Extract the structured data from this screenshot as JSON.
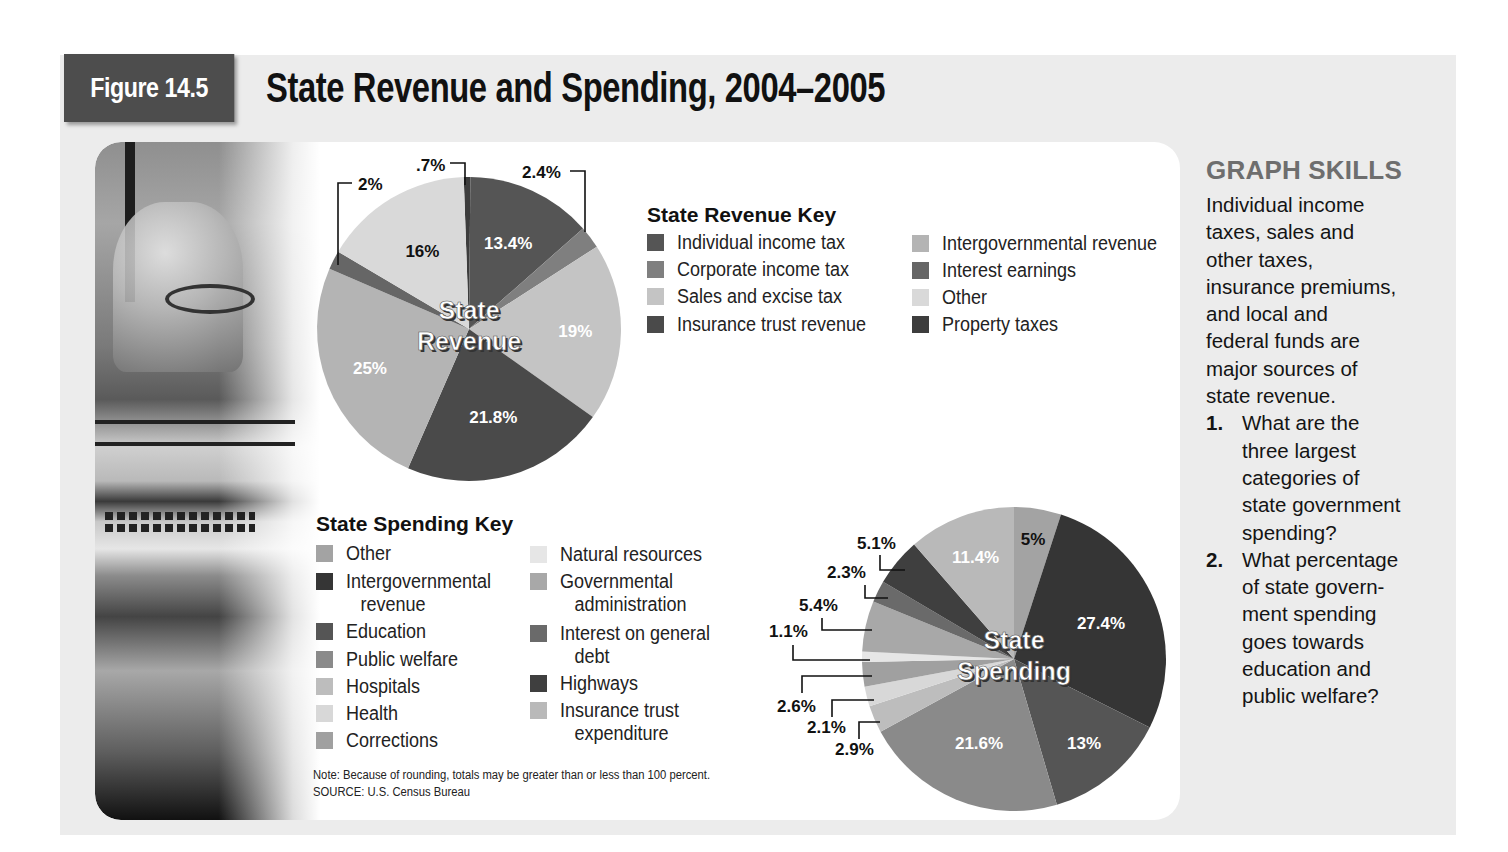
{
  "figure": {
    "tag": "Figure 14.5",
    "title": "State Revenue and Spending, 2004–2005"
  },
  "revenue_key": {
    "title": "State Revenue Key",
    "items": [
      {
        "label": "Individual income tax",
        "color": "#555555"
      },
      {
        "label": "Corporate income tax",
        "color": "#7f7f7f"
      },
      {
        "label": "Sales and excise tax",
        "color": "#c4c4c4"
      },
      {
        "label": "Insurance trust revenue",
        "color": "#4a4a4a"
      },
      {
        "label": "Intergovernmental revenue",
        "color": "#b4b4b4"
      },
      {
        "label": "Interest earnings",
        "color": "#666666"
      },
      {
        "label": "Other",
        "color": "#d9d9d9"
      },
      {
        "label": "Property taxes",
        "color": "#3d3d3d"
      }
    ]
  },
  "spending_key": {
    "title": "State Spending Key",
    "items": [
      {
        "label": "Other",
        "label2": "",
        "color": "#a3a3a3"
      },
      {
        "label": "Intergovernmental",
        "label2": "revenue",
        "color": "#353535"
      },
      {
        "label": "Education",
        "label2": "",
        "color": "#555555"
      },
      {
        "label": "Public welfare",
        "label2": "",
        "color": "#8a8a8a"
      },
      {
        "label": "Hospitals",
        "label2": "",
        "color": "#bdbdbd"
      },
      {
        "label": "Health",
        "label2": "",
        "color": "#d8d8d8"
      },
      {
        "label": "Corrections",
        "label2": "",
        "color": "#a0a0a0"
      },
      {
        "label": "Natural resources",
        "label2": "",
        "color": "#e6e6e6"
      },
      {
        "label": "Governmental",
        "label2": "administration",
        "color": "#a8a8a8"
      },
      {
        "label": "Interest on general",
        "label2": "debt",
        "color": "#6a6a6a"
      },
      {
        "label": "Highways",
        "label2": "",
        "color": "#3f3f3f"
      },
      {
        "label": "Insurance trust",
        "label2": "expenditure",
        "color": "#b9b9b9"
      }
    ]
  },
  "note": {
    "line1": "Note: Because of rounding, totals may be greater than or less than 100 percent.",
    "line2": "SOURCE: U.S. Census Bureau"
  },
  "graph_skills": {
    "title": "GRAPH SKILLS",
    "body_lines": [
      "Individual income",
      "taxes, sales and",
      "other taxes,",
      "insurance premiums,",
      "and local and",
      "federal funds are",
      "major sources of",
      "state revenue."
    ],
    "questions": [
      {
        "num": "1.",
        "lines": [
          "What are the",
          "three largest",
          "categories of",
          "state government",
          "spending?"
        ]
      },
      {
        "num": "2.",
        "lines": [
          "What percentage",
          "of state govern-",
          "ment spending",
          "goes towards",
          "education and",
          "public welfare?"
        ]
      }
    ]
  },
  "chart_data": [
    {
      "type": "pie",
      "title": "State Revenue",
      "center_label": [
        "State",
        "Revenue"
      ],
      "slices_clockwise_from_top": [
        {
          "label": "Property taxes",
          "value": 0.7,
          "text": ".7%",
          "color": "#3d3d3d"
        },
        {
          "label": "Individual income tax",
          "value": 13.4,
          "text": "13.4%",
          "color": "#555555"
        },
        {
          "label": "Corporate income tax",
          "value": 2.4,
          "text": "2.4%",
          "color": "#7f7f7f"
        },
        {
          "label": "Sales and excise tax",
          "value": 19,
          "text": "19%",
          "color": "#c4c4c4"
        },
        {
          "label": "Insurance trust revenue",
          "value": 21.8,
          "text": "21.8%",
          "color": "#4a4a4a"
        },
        {
          "label": "Intergovernmental revenue",
          "value": 25,
          "text": "25%",
          "color": "#b4b4b4"
        },
        {
          "label": "Interest earnings",
          "value": 2,
          "text": "2%",
          "color": "#666666"
        },
        {
          "label": "Other",
          "value": 16,
          "text": "16%",
          "color": "#d9d9d9"
        }
      ]
    },
    {
      "type": "pie",
      "title": "State Spending",
      "center_label": [
        "State",
        "Spending"
      ],
      "slices_clockwise_from_top": [
        {
          "label": "Other",
          "value": 5,
          "text": "5%",
          "color": "#a3a3a3"
        },
        {
          "label": "Intergovernmental revenue",
          "value": 27.4,
          "text": "27.4%",
          "color": "#353535"
        },
        {
          "label": "Education",
          "value": 13,
          "text": "13%",
          "color": "#555555"
        },
        {
          "label": "Public welfare",
          "value": 21.6,
          "text": "21.6%",
          "color": "#8a8a8a"
        },
        {
          "label": "Hospitals",
          "value": 2.9,
          "text": "2.9%",
          "color": "#bdbdbd"
        },
        {
          "label": "Health",
          "value": 2.1,
          "text": "2.1%",
          "color": "#d8d8d8"
        },
        {
          "label": "Corrections",
          "value": 2.6,
          "text": "2.6%",
          "color": "#a0a0a0"
        },
        {
          "label": "Natural resources",
          "value": 1.1,
          "text": "1.1%",
          "color": "#e6e6e6"
        },
        {
          "label": "Governmental administration",
          "value": 5.4,
          "text": "5.4%",
          "color": "#a8a8a8"
        },
        {
          "label": "Interest on general debt",
          "value": 2.3,
          "text": "2.3%",
          "color": "#6a6a6a"
        },
        {
          "label": "Highways",
          "value": 5.1,
          "text": "5.1%",
          "color": "#3f3f3f"
        },
        {
          "label": "Insurance trust expenditure",
          "value": 11.4,
          "text": "11.4%",
          "color": "#b9b9b9"
        }
      ]
    }
  ]
}
